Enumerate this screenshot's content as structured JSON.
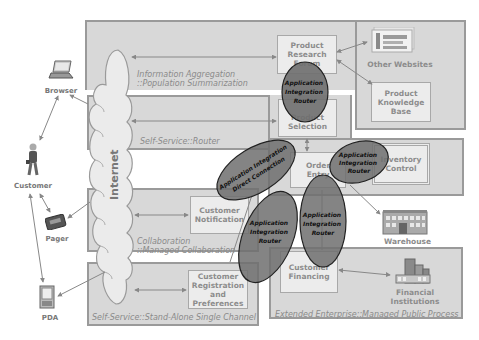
{
  "actors": {
    "browser": "Browser",
    "customer": "Customer",
    "pager": "Pager",
    "pda": "PDA"
  },
  "cloud": {
    "label": "Internet"
  },
  "zones": {
    "info_aggregation": {
      "line1": "Information Aggregation",
      "line2": "::Population Summarization"
    },
    "self_service_router": {
      "label": "Self-Service::Router"
    },
    "collaboration": {
      "line1": "Collaboration",
      "line2": "::Managed Collaboration"
    },
    "self_service_standalone": {
      "label": "Self-Service::Stand-Alone Single Channel"
    },
    "extended_enterprise": {
      "label": "Extended Enterprise::Managed Public Process"
    }
  },
  "nodes": {
    "product_research_forum": {
      "lines": [
        "Product",
        "Research",
        "Forum"
      ]
    },
    "product_knowledge_base": {
      "lines": [
        "Product",
        "Knowledge",
        "Base"
      ]
    },
    "product_selection": {
      "lines": [
        "Product",
        "Selection"
      ]
    },
    "order_entry": {
      "lines": [
        "Order",
        "Entry"
      ]
    },
    "inventory_control": {
      "lines": [
        "Inventory",
        "Control"
      ]
    },
    "customer_notification": {
      "lines": [
        "Customer",
        "Notification"
      ]
    },
    "customer_registration": {
      "lines": [
        "Customer",
        "Registration",
        "and",
        "Preferences"
      ]
    },
    "customer_financing": {
      "lines": [
        "Customer",
        "Financing"
      ]
    }
  },
  "external": {
    "other_websites": "Other Websites",
    "warehouse": "Warehouse",
    "financial_institutions": {
      "line1": "Financial",
      "line2": "Institutions"
    }
  },
  "routers": {
    "top": {
      "lines": [
        "Application",
        "Integration",
        "Router"
      ]
    },
    "direct": {
      "lines": [
        "Application Integration",
        "Direct Connection"
      ]
    },
    "right": {
      "lines": [
        "Application",
        "Integration",
        "Router"
      ]
    },
    "lower_left": {
      "lines": [
        "Application",
        "Integration",
        "Router"
      ]
    },
    "lower_right": {
      "lines": [
        "Application",
        "Integration",
        "Router"
      ]
    }
  },
  "colors": {
    "zone_fill": "#d8d8d8",
    "zone_border": "#9a9a9a",
    "node_fill": "#ececec",
    "router_fill": "#6e6e6e",
    "cloud_fill": "#ebebeb"
  }
}
